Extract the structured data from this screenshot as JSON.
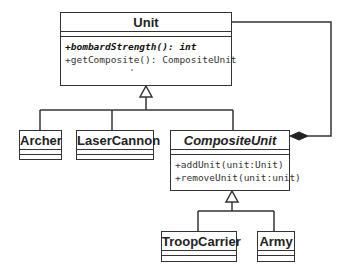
{
  "diagram": {
    "type": "UML class diagram",
    "classes": {
      "unit": {
        "name": "Unit",
        "abstract": false,
        "operations": [
          {
            "text": "+bombardStrength(): int",
            "abstract": true
          },
          {
            "text": "+getComposite(): CompositeUnit",
            "abstract": false
          }
        ]
      },
      "archer": {
        "name": "Archer"
      },
      "laser_cannon": {
        "name": "LaserCannon"
      },
      "composite_unit": {
        "name": "CompositeUnit",
        "abstract": true,
        "operations": [
          {
            "text": "+addUnit(unit:Unit)",
            "abstract": false
          },
          {
            "text": "+removeUnit(unit:unit)",
            "abstract": false
          }
        ]
      },
      "troop_carrier": {
        "name": "TroopCarrier"
      },
      "army": {
        "name": "Army"
      }
    },
    "relationships": [
      {
        "type": "generalization",
        "from": "Archer",
        "to": "Unit"
      },
      {
        "type": "generalization",
        "from": "LaserCannon",
        "to": "Unit"
      },
      {
        "type": "generalization",
        "from": "CompositeUnit",
        "to": "Unit"
      },
      {
        "type": "generalization",
        "from": "TroopCarrier",
        "to": "CompositeUnit"
      },
      {
        "type": "generalization",
        "from": "Army",
        "to": "CompositeUnit"
      },
      {
        "type": "composition",
        "from": "CompositeUnit",
        "to": "Unit"
      }
    ],
    "colors": {
      "line": "#333333",
      "background": "#ffffff"
    }
  }
}
